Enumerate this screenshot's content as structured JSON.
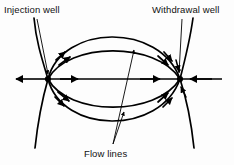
{
  "figure": {
    "kind": "flow-net-diagram",
    "background_color": "#fdfdfd",
    "line_color": "#000000",
    "labels": {
      "injection_well": "Injection well",
      "withdrawal_well": "Withdrawal well",
      "flow_lines": "Flow lines"
    },
    "icons": {
      "injection_well_node": "well-node-icon",
      "withdrawal_well_node": "well-node-icon",
      "arrowhead": "arrowhead-icon",
      "leader_line": "leader-line-icon"
    },
    "geometry": {
      "injection_well_point": [
        48,
        79
      ],
      "withdrawal_well_point": [
        180,
        79
      ],
      "axis_y": 79,
      "axis_x_start": 14,
      "axis_x_end": 224,
      "flow_lines_leader_origin": [
        113,
        144
      ]
    }
  }
}
